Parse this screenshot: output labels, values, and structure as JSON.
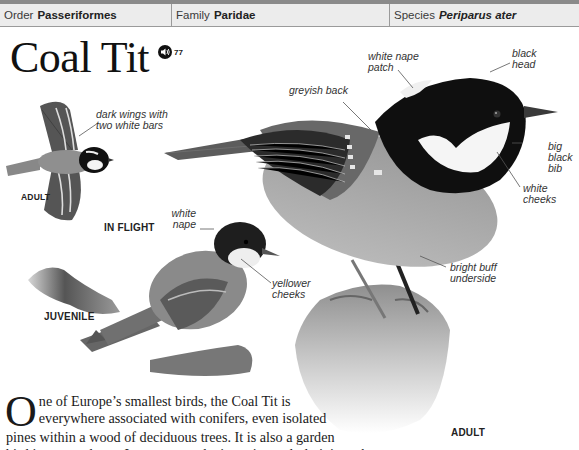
{
  "header": {
    "cells": [
      {
        "key": "Order",
        "value": "Passeriformes",
        "italic": false
      },
      {
        "key": "Family",
        "value": "Paridae",
        "italic": false
      },
      {
        "key": "Species",
        "value": "Periparus ater",
        "italic": true
      }
    ]
  },
  "title": "Coal Tit",
  "audio": {
    "icon": "speaker-icon",
    "track": "77"
  },
  "illustrations": {
    "flight": {
      "caption": "IN FLIGHT",
      "age_label": "ADULT",
      "annotations": [
        {
          "text_line1": "dark wings with",
          "text_line2": "two white bars"
        }
      ]
    },
    "juvenile": {
      "caption": "JUVENILE",
      "annotations": [
        {
          "text_line1": "white",
          "text_line2": "nape"
        },
        {
          "text_line1": "yellower",
          "text_line2": "cheeks"
        }
      ]
    },
    "adult": {
      "caption": "ADULT",
      "annotations": [
        {
          "text_line1": "white nape",
          "text_line2": "patch"
        },
        {
          "text_line1": "black",
          "text_line2": "head"
        },
        {
          "text_line1": "greyish back",
          "text_line2": ""
        },
        {
          "text_line1": "big",
          "text_line2": "black",
          "text_line3": "bib"
        },
        {
          "text_line1": "white",
          "text_line2": "cheeks"
        },
        {
          "text_line1": "bright buff",
          "text_line2": "underside"
        }
      ]
    }
  },
  "description": {
    "dropcap": "O",
    "lines": [
      "ne of Europe’s smallest birds, the Coal Tit is",
      "everywhere associated with conifers, even isolated",
      "pines within a wood of deciduous trees. It is also a garden",
      "bird in many places. In autumn and winter, it regularly joins other"
    ]
  },
  "colors": {
    "header_bg": "#ececec",
    "header_border_top": "#8a8a8a",
    "divider": "#9a9a9a",
    "text": "#1a1a1a",
    "annotation": "#333333"
  }
}
